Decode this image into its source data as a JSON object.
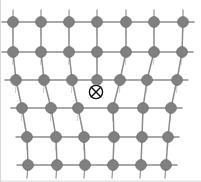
{
  "figure": {
    "title": "Edge dislocation in a crystal lattice",
    "caption": "",
    "width": 201,
    "height": 182,
    "background_color": "#ffffff"
  },
  "style": {
    "atom_fill": "#808080",
    "atom_stroke": "#6e6e6e",
    "atom_radius": 5.4,
    "bond_color": "#8c8c8c",
    "bond_width": 1.5,
    "stub_color": "#9a9a9a",
    "stub_width": 1.3,
    "symbol_stroke": "#111111",
    "symbol_stroke_width": 1.4,
    "symbol_radius": 6.6,
    "border_color": "#d8d8d8",
    "border_width": 1
  },
  "chart_data": {
    "type": "diagram",
    "subtype": "crystal-lattice-edge-dislocation",
    "title": "Edge dislocation in a crystal lattice",
    "xlabel": "",
    "ylabel": "",
    "xlim": [
      0,
      201
    ],
    "ylim": [
      0,
      182
    ],
    "grid": false,
    "legend": null,
    "rows": [
      {
        "index": 0,
        "y": 22,
        "atom_count": 7,
        "x": [
          13,
          41,
          69,
          97,
          126,
          154,
          183
        ]
      },
      {
        "index": 1,
        "y": 52,
        "atom_count": 7,
        "x": [
          13,
          41,
          69,
          97,
          126,
          154,
          182
        ]
      },
      {
        "index": 2,
        "y": 80,
        "atom_count": 7,
        "x": [
          16,
          44,
          72,
          97,
          120,
          147,
          177
        ]
      },
      {
        "index": 3,
        "y": 108,
        "atom_count": 6,
        "x": [
          22,
          51,
          78,
          113,
          143,
          171
        ]
      },
      {
        "index": 4,
        "y": 137,
        "atom_count": 6,
        "x": [
          27,
          56,
          84,
          114,
          142,
          168
        ]
      },
      {
        "index": 5,
        "y": 165,
        "atom_count": 6,
        "x": [
          28,
          57,
          85,
          113,
          141,
          166
        ]
      }
    ],
    "dislocation_symbol": {
      "name": "circled-cross",
      "glyph": "⊗",
      "meaning": "edge dislocation line into the page",
      "x": 96,
      "y": 92,
      "radius": 6.6
    },
    "extra_half_plane": {
      "present": true,
      "terminates_at_row": 2,
      "column_x": 97,
      "note": "Seventh column in rows 0-2 has no counterpart in rows 3-5"
    }
  }
}
